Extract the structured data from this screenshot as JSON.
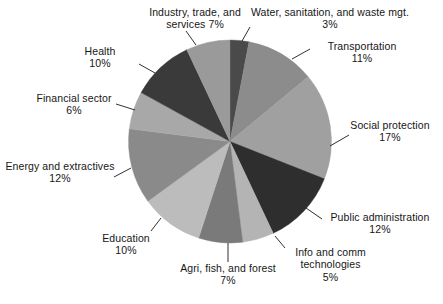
{
  "chart_data": {
    "type": "pie",
    "title": "",
    "subtitle": "",
    "xlabel": "",
    "ylabel": "",
    "legend_position": "none",
    "grid": false,
    "value_unit": "%",
    "start_angle_deg": 0,
    "direction": "clockwise",
    "categories": [
      "Water, sanitation, and waste mgt.",
      "Transportation",
      "Social protection",
      "Public administration",
      "Info and comm technologies",
      "Agri, fish, and forest",
      "Education",
      "Energy and extractives",
      "Financial sector",
      "Health",
      "Industry, trade, and services"
    ],
    "values": [
      3,
      11,
      17,
      12,
      5,
      7,
      10,
      12,
      6,
      10,
      7
    ],
    "colors": [
      "#4a4a4a",
      "#8c8c8c",
      "#a0a0a0",
      "#2e2e2e",
      "#b4b4b4",
      "#7a7a7a",
      "#bcbcbc",
      "#8a8a8a",
      "#a8a8a8",
      "#3a3a3a",
      "#9a9a9a"
    ],
    "slices": [
      {
        "label": "Water, sanitation, and waste mgt.",
        "percent_text": "3%",
        "value": 3,
        "color": "#4a4a4a"
      },
      {
        "label": "Transportation",
        "percent_text": "11%",
        "value": 11,
        "color": "#8c8c8c"
      },
      {
        "label": "Social protection",
        "percent_text": "17%",
        "value": 17,
        "color": "#a0a0a0"
      },
      {
        "label": "Public administration",
        "percent_text": "12%",
        "value": 12,
        "color": "#2e2e2e"
      },
      {
        "label": "Info and comm technologies",
        "percent_text": "5%",
        "value": 5,
        "color": "#b4b4b4"
      },
      {
        "label": "Agri, fish, and forest",
        "percent_text": "7%",
        "value": 7,
        "color": "#7a7a7a"
      },
      {
        "label": "Education",
        "percent_text": "10%",
        "value": 10,
        "color": "#bcbcbc"
      },
      {
        "label": "Energy and extractives",
        "percent_text": "12%",
        "value": 12,
        "color": "#8a8a8a"
      },
      {
        "label": "Financial sector",
        "percent_text": "6%",
        "value": 6,
        "color": "#a8a8a8"
      },
      {
        "label": "Health",
        "percent_text": "10%",
        "value": 10,
        "color": "#3a3a3a"
      },
      {
        "label": "Industry, trade, and services",
        "percent_text": "7%",
        "value": 7,
        "color": "#9a9a9a"
      }
    ]
  },
  "labels": {
    "industry": {
      "line1": "Industry, trade, and",
      "line2": "services",
      "percent": "7%"
    },
    "water": {
      "line1": "Water, sanitation, and waste mgt.",
      "percent": "3%"
    },
    "transportation": {
      "line1": "Transportation",
      "percent": "11%"
    },
    "social_protection": {
      "line1": "Social protection",
      "percent": "17%"
    },
    "public_administration": {
      "line1": "Public administration",
      "percent": "12%"
    },
    "info_comm": {
      "line1": "Info and comm",
      "line2": "technologies",
      "percent": "5%"
    },
    "agri": {
      "line1": "Agri, fish, and forest",
      "percent": "7%"
    },
    "education": {
      "line1": "Education",
      "percent": "10%"
    },
    "energy": {
      "line1": "Energy and extractives",
      "percent": "12%"
    },
    "financial": {
      "line1": "Financial sector",
      "percent": "6%"
    },
    "health": {
      "line1": "Health",
      "percent": "10%"
    }
  }
}
